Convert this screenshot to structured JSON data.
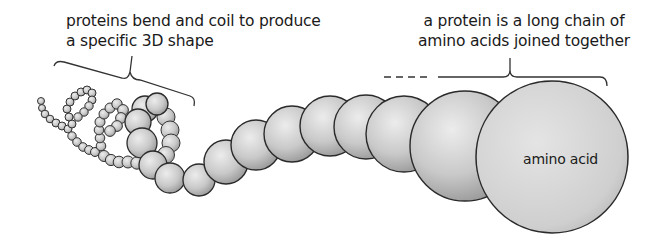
{
  "diagram": {
    "labels": {
      "left_line1": "proteins bend and coil to produce",
      "left_line2": "a specific 3D shape",
      "right_line1": "a protein is a long chain of",
      "right_line2": "amino acids joined together",
      "sphere": "amino acid"
    },
    "colors": {
      "sphere_fill_light": "#e6e6e6",
      "sphere_fill_dark": "#9a9a9a",
      "outline": "#2a2a2a",
      "text": "#1a1a1a",
      "background": "#ffffff"
    }
  }
}
